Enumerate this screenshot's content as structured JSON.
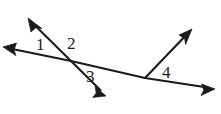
{
  "figure": {
    "kind": "geometry-diagram",
    "background_color": "#ffffff",
    "stroke_color": "#1a1a1a",
    "label_color": "#1a1a1a",
    "stroke_width": 2.1,
    "width": 221,
    "height": 114,
    "labels": [
      {
        "id": "1",
        "text": "1",
        "x": 36,
        "y": 36
      },
      {
        "id": "2",
        "text": "2",
        "x": 67,
        "y": 35
      },
      {
        "id": "3",
        "text": "3",
        "x": 86,
        "y": 68
      },
      {
        "id": "4",
        "text": "4",
        "x": 162,
        "y": 64
      }
    ],
    "points": {
      "intersection": {
        "x": 71,
        "y": 61
      },
      "ray_vertex": {
        "x": 145,
        "y": 78
      },
      "transversal_left_tip": {
        "x": 3,
        "y": 47
      },
      "transversal_right_tip": {
        "x": 215,
        "y": 89
      },
      "crossing_upleft_tip": {
        "x": 28,
        "y": 18
      },
      "crossing_downright_tip": {
        "x": 106,
        "y": 96
      },
      "ray_upright_tip": {
        "x": 192,
        "y": 29
      }
    },
    "segments": [
      {
        "name": "transversal-line",
        "from": "transversal_left_tip",
        "to": "transversal_right_tip",
        "arrows": "both"
      },
      {
        "name": "crossing-line",
        "from": "crossing_upleft_tip",
        "to": "crossing_downright_tip",
        "arrows": "both"
      },
      {
        "name": "upright-ray",
        "from": "ray_vertex",
        "to": "ray_upright_tip",
        "arrows": "end"
      }
    ]
  }
}
